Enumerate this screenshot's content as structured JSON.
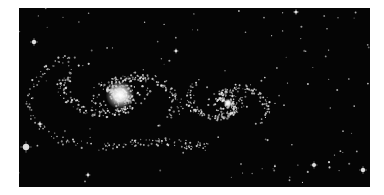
{
  "image": {
    "subject": "interacting spiral galaxies",
    "background_color": "#050505",
    "star_color": "#e8e8e8",
    "frame": {
      "x": 19,
      "y": 8,
      "width": 351,
      "height": 179
    }
  },
  "galaxies": [
    {
      "name": "left-galaxy",
      "core": {
        "x": 120,
        "y": 95
      },
      "core_radius": 9,
      "disk_rx": 55,
      "disk_ry": 32,
      "density": 420
    },
    {
      "name": "right-galaxy",
      "core": {
        "x": 228,
        "y": 103
      },
      "core_radius": 3,
      "disk_rx": 38,
      "disk_ry": 26,
      "density": 300
    }
  ],
  "bright_stars": [
    {
      "x": 26,
      "y": 147,
      "r": 3.2
    },
    {
      "x": 34,
      "y": 42,
      "r": 2.2
    },
    {
      "x": 314,
      "y": 165,
      "r": 2.0
    },
    {
      "x": 363,
      "y": 170,
      "r": 2.2
    },
    {
      "x": 296,
      "y": 12,
      "r": 1.6
    },
    {
      "x": 88,
      "y": 175,
      "r": 1.4
    },
    {
      "x": 40,
      "y": 124,
      "r": 1.6
    },
    {
      "x": 176,
      "y": 51,
      "r": 1.4
    }
  ]
}
